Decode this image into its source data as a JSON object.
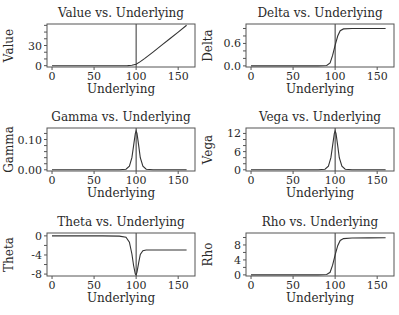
{
  "chart_data": [
    {
      "type": "line",
      "title": "Value vs. Underlying",
      "xlabel": "Underlying",
      "ylabel": "Value",
      "xlim": [
        -6,
        170
      ],
      "ylim": [
        -2,
        62
      ],
      "xticks": [
        0,
        50,
        100,
        150
      ],
      "yticks": [
        0,
        30
      ],
      "yminor": [
        0,
        10,
        20,
        30,
        40,
        50,
        60
      ],
      "strike_line": 100,
      "x": [
        0,
        20,
        40,
        60,
        80,
        90,
        95,
        100,
        105,
        110,
        120,
        130,
        140,
        150,
        160
      ],
      "y": [
        0,
        0,
        0,
        0,
        0,
        0.05,
        0.6,
        2.2,
        6,
        10.5,
        20.2,
        30.1,
        40.1,
        50,
        60
      ]
    },
    {
      "type": "line",
      "title": "Delta vs. Underlying",
      "xlabel": "Underlying",
      "ylabel": "Delta",
      "xlim": [
        -6,
        170
      ],
      "ylim": [
        -0.03,
        1.12
      ],
      "xticks": [
        0,
        50,
        100,
        150
      ],
      "yticks": [
        0.0,
        0.6
      ],
      "ytick_labels": [
        "0.0",
        "0.6"
      ],
      "yminor": [
        0,
        0.2,
        0.4,
        0.6,
        0.8,
        1.0
      ],
      "strike_line": 100,
      "x": [
        0,
        20,
        40,
        60,
        80,
        90,
        94,
        97,
        100,
        103,
        106,
        110,
        120,
        140,
        160
      ],
      "y": [
        0,
        0,
        0,
        0,
        0,
        0.01,
        0.08,
        0.28,
        0.55,
        0.8,
        0.94,
        0.99,
        1.0,
        1.0,
        1.0
      ]
    },
    {
      "type": "line",
      "title": "Gamma vs. Underlying",
      "xlabel": "Underlying",
      "ylabel": "Gamma",
      "xlim": [
        -6,
        170
      ],
      "ylim": [
        -0.004,
        0.138
      ],
      "xticks": [
        0,
        50,
        100,
        150
      ],
      "yticks": [
        0.0,
        0.1
      ],
      "ytick_labels": [
        "0.00",
        "0.10"
      ],
      "yminor": [
        0,
        0.02,
        0.04,
        0.06,
        0.08,
        0.1,
        0.12
      ],
      "strike_line": 100,
      "x": [
        0,
        20,
        40,
        60,
        80,
        88,
        92,
        95,
        97,
        99,
        100,
        101,
        103,
        105,
        108,
        112,
        120,
        140,
        160
      ],
      "y": [
        0,
        0,
        0,
        0,
        0,
        0.002,
        0.012,
        0.04,
        0.08,
        0.12,
        0.128,
        0.12,
        0.08,
        0.04,
        0.012,
        0.002,
        0,
        0,
        0
      ]
    },
    {
      "type": "line",
      "title": "Vega vs. Underlying",
      "xlabel": "Underlying",
      "ylabel": "Vega",
      "xlim": [
        -6,
        170
      ],
      "ylim": [
        -0.4,
        13.8
      ],
      "xticks": [
        0,
        50,
        100,
        150
      ],
      "yticks": [
        0,
        6,
        12
      ],
      "yminor": [
        0,
        2,
        4,
        6,
        8,
        10,
        12
      ],
      "strike_line": 100,
      "x": [
        0,
        20,
        40,
        60,
        80,
        88,
        92,
        95,
        97,
        99,
        100,
        101,
        103,
        105,
        108,
        112,
        120,
        140,
        160
      ],
      "y": [
        0,
        0,
        0,
        0,
        0,
        0.2,
        1.2,
        4,
        8,
        12,
        12.8,
        12,
        8,
        4,
        1.2,
        0.2,
        0,
        0,
        0
      ]
    },
    {
      "type": "line",
      "title": "Theta vs. Underlying",
      "xlabel": "Underlying",
      "ylabel": "Theta",
      "xlim": [
        -6,
        170
      ],
      "ylim": [
        -8.4,
        0.6
      ],
      "xticks": [
        0,
        50,
        100,
        150
      ],
      "yticks": [
        0,
        -4,
        -8
      ],
      "yminor": [
        0,
        -2,
        -4,
        -6,
        -8
      ],
      "strike_line": 100,
      "x": [
        0,
        20,
        40,
        60,
        80,
        88,
        92,
        95,
        97,
        99,
        100,
        101,
        103,
        105,
        108,
        112,
        120,
        140,
        160
      ],
      "y": [
        0,
        0,
        0,
        0,
        -0.05,
        -0.3,
        -1.3,
        -3.8,
        -6.2,
        -8.0,
        -8.2,
        -7.6,
        -5.6,
        -3.9,
        -3.1,
        -2.95,
        -2.95,
        -2.95,
        -2.95
      ]
    },
    {
      "type": "line",
      "title": "Rho vs. Underlying",
      "xlabel": "Underlying",
      "ylabel": "Rho",
      "xlim": [
        -6,
        170
      ],
      "ylim": [
        -0.3,
        11.2
      ],
      "xticks": [
        0,
        50,
        100,
        150
      ],
      "yticks": [
        0,
        4,
        8
      ],
      "yminor": [
        0,
        2,
        4,
        6,
        8,
        10
      ],
      "strike_line": 100,
      "x": [
        0,
        20,
        40,
        60,
        80,
        90,
        94,
        97,
        100,
        103,
        106,
        110,
        120,
        140,
        160
      ],
      "y": [
        0,
        0,
        0,
        0,
        0,
        0.1,
        0.7,
        2.6,
        5.3,
        7.8,
        9.2,
        9.7,
        9.85,
        9.9,
        9.95
      ]
    }
  ],
  "layout": {
    "columns": [
      {
        "left": 47,
        "right": 195
      },
      {
        "left": 246,
        "right": 394
      }
    ],
    "rows": [
      {
        "top": 24,
        "bottom": 67
      },
      {
        "top": 128,
        "bottom": 171
      },
      {
        "top": 233,
        "bottom": 276
      }
    ]
  }
}
